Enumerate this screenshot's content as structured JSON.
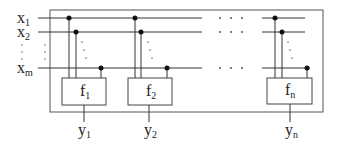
{
  "diagram": {
    "title": "",
    "inputs": [
      {
        "id": "x1",
        "label": "x",
        "sub": "1",
        "y": 18
      },
      {
        "id": "x2",
        "label": "x",
        "sub": "2",
        "y": 32
      },
      {
        "id": "xm",
        "label": "x",
        "sub": "m",
        "y": 68
      }
    ],
    "functions": [
      {
        "id": "f1",
        "label": "f",
        "sub": "1",
        "output": {
          "label": "y",
          "sub": "1"
        }
      },
      {
        "id": "f2",
        "label": "f",
        "sub": "2",
        "output": {
          "label": "y",
          "sub": "2"
        }
      },
      {
        "id": "fn",
        "label": "f",
        "sub": "n",
        "output": {
          "label": "y",
          "sub": "n"
        }
      }
    ],
    "ellipsis": "· · ·",
    "colors": {
      "line": "#333333",
      "box": "#444444",
      "dot": "#111111",
      "background": "#ffffff"
    }
  }
}
